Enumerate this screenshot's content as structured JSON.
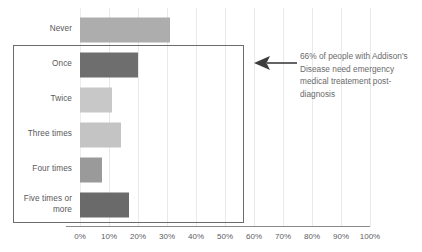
{
  "chart_data": {
    "type": "bar",
    "orientation": "horizontal",
    "title": "",
    "xlabel": "",
    "ylabel": "",
    "categories": [
      "Never",
      "Once",
      "Twice",
      "Three times",
      "Four times",
      "Five times or more"
    ],
    "values": [
      31,
      20,
      11,
      14,
      7.5,
      17
    ],
    "value_suffix": "%",
    "xlim": [
      0,
      100
    ],
    "tick_labels": [
      "0%",
      "10%",
      "20%",
      "30%",
      "40%",
      "50%",
      "60%",
      "70%",
      "80%",
      "90%",
      "100%"
    ],
    "tick_values": [
      0,
      10,
      20,
      30,
      40,
      50,
      60,
      70,
      80,
      90,
      100
    ],
    "grid": "vertical",
    "legend": "none",
    "bar_colors": [
      "#adadad",
      "#6e6e6e",
      "#c8c8c8",
      "#c4c4c4",
      "#9a9a9a",
      "#6a6a6a"
    ],
    "annotations": [
      {
        "text": "66% of people with Addison's Disease need emergency medical treatement post-diagnosis",
        "arrow": "left",
        "highlight": "rectangle around categories Once through Five times or more"
      }
    ]
  },
  "annotation": {
    "text": "66% of people with Addison's Disease need emergency medical treatement post-diagnosis"
  },
  "colors": {
    "gridline": "#e9e9e9",
    "axis": "#8a8a8a",
    "highlight_border": "#6b6b6b",
    "text": "#58585a",
    "annotation_text": "#6a6a6c",
    "arrow": "#3d3d3d"
  }
}
